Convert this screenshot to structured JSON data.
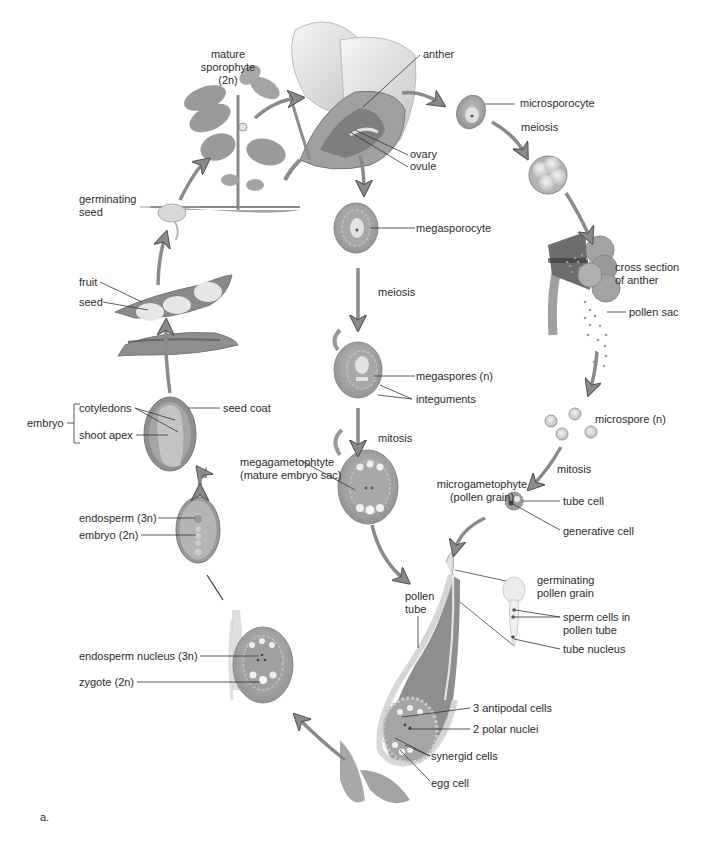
{
  "figure": {
    "panel_label": "a.",
    "colors": {
      "tissue": "#9c9c9c",
      "tissue_dark": "#7d7d7d",
      "tissue_light": "#c9c9c9",
      "cell": "#e4e4e4",
      "arrow": "#8a8a8a",
      "line": "#333333",
      "text": "#2b2b2b"
    }
  },
  "stages": {
    "sporophyte": {
      "line1": "mature",
      "line2": "sporophyte",
      "line3": "(2n)"
    },
    "flower": {
      "anther": "anther",
      "ovary": "ovary",
      "ovule": "ovule"
    },
    "microsporocyte": "microsporocyte",
    "meiosis_male": "meiosis",
    "anther_section": {
      "line1": "cross section",
      "line2": "of anther",
      "pollen_sac": "pollen sac"
    },
    "microspore": "microspore (n)",
    "mitosis_male": "mitosis",
    "microgametophyte": {
      "line1": "microgametophyte",
      "line2": "(pollen grain)",
      "tube_cell": "tube cell",
      "generative_cell": "generative cell"
    },
    "germinating_pollen": {
      "line1": "germinating",
      "line2": "pollen grain",
      "sperm1": "sperm cells in",
      "sperm2": "pollen tube",
      "tube_nucleus": "tube nucleus"
    },
    "megasporocyte": "megasporocyte",
    "meiosis_female": "meiosis",
    "megaspores": "megaspores (n)",
    "integuments": "integuments",
    "mitosis_female": "mitosis",
    "megagametophyte": {
      "line1": "megagametophtyte",
      "line2": "(mature embryo sac)"
    },
    "fertilization": {
      "pollen_tube1": "pollen",
      "pollen_tube2": "tube",
      "antipodal": "3 antipodal cells",
      "polar": "2 polar nuclei",
      "synergid": "synergid cells",
      "egg": "egg cell"
    },
    "zygote_stage": {
      "endosperm_nucleus": "endosperm nucleus (3n)",
      "zygote": "zygote (2n)"
    },
    "developing_seed": {
      "endosperm": "endosperm (3n)",
      "embryo": "embryo (2n)"
    },
    "mature_seed": {
      "embryo": "embryo",
      "cotyledons": "cotyledons",
      "shoot_apex": "shoot apex",
      "seed_coat": "seed coat"
    },
    "fruit": {
      "fruit": "fruit",
      "seed": "seed"
    },
    "germinating_seed": {
      "line1": "germinating",
      "line2": "seed"
    }
  }
}
